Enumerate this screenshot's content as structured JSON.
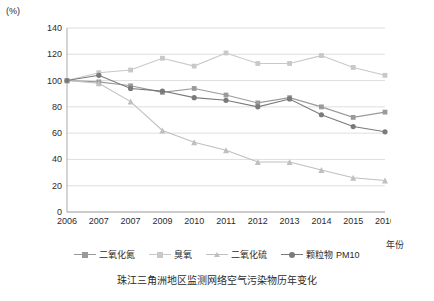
{
  "axis": {
    "y_unit": "(%)",
    "x_unit": "年份"
  },
  "caption": "珠江三角洲地区监测网络空气污染物历年变化",
  "legend": [
    {
      "label": "二氧化氮",
      "color": "#9a9a9a",
      "marker": "square"
    },
    {
      "label": "臭氧",
      "color": "#c8c8c8",
      "marker": "square"
    },
    {
      "label": "二氧化硫",
      "color": "#bfbfbf",
      "marker": "triangle"
    },
    {
      "label": "颗粒物 PM10",
      "color": "#7a7a7a",
      "marker": "circle"
    }
  ],
  "chart_data": {
    "type": "line",
    "title": "珠江三角洲地区监测网络空气污染物历年变化",
    "xlabel": "年份",
    "ylabel": "(%)",
    "ylim": [
      0,
      140
    ],
    "yticks": [
      0,
      20,
      40,
      60,
      80,
      100,
      120,
      140
    ],
    "grid": true,
    "legend_position": "bottom",
    "categories": [
      "2006",
      "2007",
      "2007",
      "2009",
      "2010",
      "2011",
      "2012",
      "2013",
      "2014",
      "2015",
      "2016"
    ],
    "series": [
      {
        "name": "二氧化氮",
        "color": "#9a9a9a",
        "marker": "square",
        "values": [
          100,
          99,
          96,
          91,
          94,
          89,
          83,
          87,
          80,
          72,
          76
        ]
      },
      {
        "name": "臭氧",
        "color": "#c8c8c8",
        "marker": "square",
        "values": [
          100,
          106,
          108,
          117,
          111,
          121,
          113,
          113,
          119,
          110,
          104
        ]
      },
      {
        "name": "二氧化硫",
        "color": "#bfbfbf",
        "marker": "triangle",
        "values": [
          100,
          98,
          84,
          62,
          53,
          47,
          38,
          38,
          32,
          26,
          24
        ]
      },
      {
        "name": "颗粒物 PM10",
        "color": "#7a7a7a",
        "marker": "circle",
        "values": [
          100,
          104,
          94,
          92,
          87,
          85,
          80,
          86,
          74,
          65,
          61
        ]
      }
    ]
  }
}
